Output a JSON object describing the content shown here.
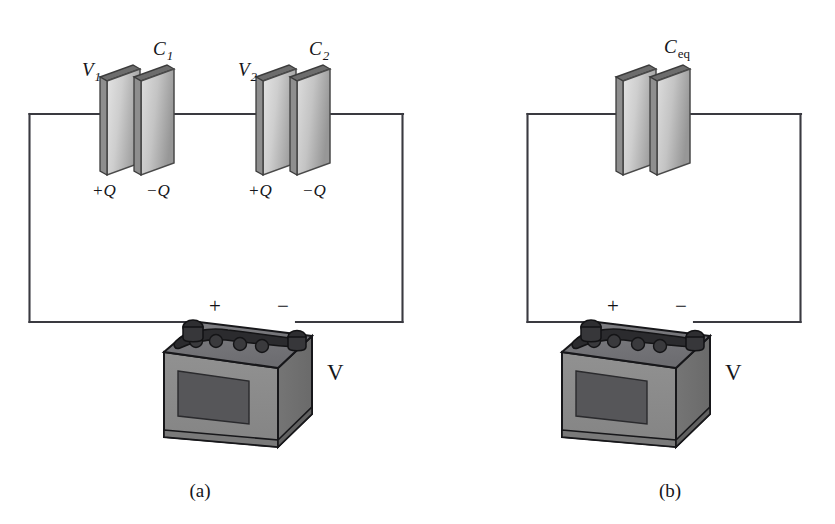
{
  "figure": {
    "background_color": "#ffffff",
    "wire_color": "#3a3a40",
    "plate_face_light": "#d8d8d8",
    "plate_face_dark": "#9a9a9a",
    "plate_edge_color": "#4a4a4a",
    "battery_front_color": "#8a8a8a",
    "battery_side_color": "#6e6e6e",
    "battery_top_color": "#747478",
    "battery_label_color": "#565659",
    "battery_outline_color": "#17171a"
  },
  "panels": [
    {
      "id": "panel-a",
      "caption": "(a)",
      "caption_x": 200,
      "caption_y": 497,
      "capacitors": [
        {
          "id": "c1",
          "c_label": "C",
          "c_subscript": "1",
          "v_label": "V",
          "v_subscript": "1",
          "positive_charge": "+Q",
          "negative_charge": "−Q"
        },
        {
          "id": "c2",
          "c_label": "C",
          "c_subscript": "2",
          "v_label": "V",
          "v_subscript": "2",
          "positive_charge": "+Q",
          "negative_charge": "−Q"
        }
      ],
      "battery": {
        "positive_terminal": "+",
        "negative_terminal": "−",
        "voltage_label": "V"
      }
    },
    {
      "id": "panel-b",
      "caption": "(b)",
      "caption_x": 670,
      "caption_y": 497,
      "capacitors": [
        {
          "id": "ceq",
          "c_label": "C",
          "c_subscript": "eq",
          "subscript_style": "roman",
          "v_label": "",
          "v_subscript": "",
          "positive_charge": "",
          "negative_charge": ""
        }
      ],
      "battery": {
        "positive_terminal": "+",
        "negative_terminal": "−",
        "voltage_label": "V"
      }
    }
  ]
}
